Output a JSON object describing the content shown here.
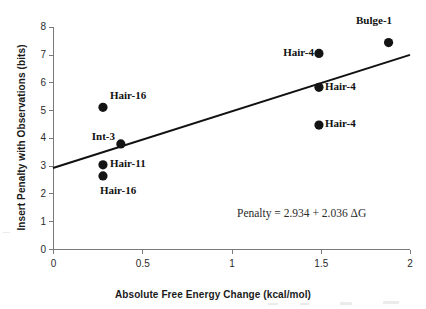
{
  "chart_data": {
    "type": "scatter",
    "title": "",
    "xlabel": "Absolute Free Energy Change (kcal/mol)",
    "ylabel": "Insert Penalty with Observations (bits)",
    "xlim": [
      0,
      2
    ],
    "ylim": [
      0,
      8
    ],
    "xticks": [
      "0",
      "0.5",
      "1",
      "1.5",
      "2"
    ],
    "xtick_values": [
      0,
      0.5,
      1,
      1.5,
      2
    ],
    "yticks": [
      "0",
      "1",
      "2",
      "3",
      "4",
      "5",
      "6",
      "7",
      "8"
    ],
    "ytick_values": [
      0,
      1,
      2,
      3,
      4,
      5,
      6,
      7,
      8
    ],
    "grid": false,
    "legend": "none",
    "points": [
      {
        "label": "Hair-16",
        "x": 0.28,
        "y": 5.12,
        "label_pos": "right"
      },
      {
        "label": "Int-3",
        "x": 0.38,
        "y": 3.8,
        "label_pos": "left"
      },
      {
        "label": "Hair-11",
        "x": 0.28,
        "y": 3.05,
        "label_pos": "right"
      },
      {
        "label": "Hair-16",
        "x": 0.28,
        "y": 2.65,
        "label_pos": "below"
      },
      {
        "label": "Hair-4",
        "x": 1.49,
        "y": 7.06,
        "label_pos": "left"
      },
      {
        "label": "Hair-4",
        "x": 1.49,
        "y": 5.84,
        "label_pos": "right"
      },
      {
        "label": "Hair-4",
        "x": 1.49,
        "y": 4.48,
        "label_pos": "right"
      },
      {
        "label": "Bulge-1",
        "x": 1.88,
        "y": 7.45,
        "label_pos": "above"
      }
    ],
    "trendline": {
      "equation_text": "Penalty = 2.934 + 2.036 ΔG",
      "intercept": 2.934,
      "slope": 2.036,
      "x_start": 0,
      "x_end": 2,
      "y_start": 2.934,
      "y_end": 7.006
    },
    "colors": {
      "marker": "#141414",
      "trendline": "#111111",
      "axis": "#7a7a7a",
      "text": "#1a1a1a",
      "background": "#ffffff"
    }
  }
}
